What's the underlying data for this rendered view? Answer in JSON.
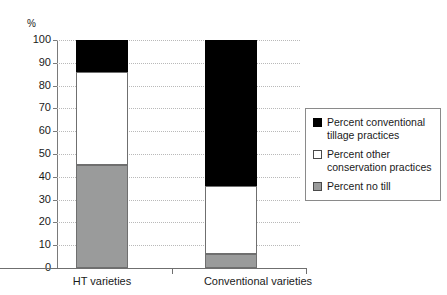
{
  "chart_data": {
    "type": "bar",
    "subtype": "stacked-bar-100",
    "title": "",
    "subtitle": "",
    "xlabel": "",
    "ylabel": "%",
    "ylim": [
      0,
      100
    ],
    "ytick_values": [
      0,
      10,
      20,
      30,
      40,
      50,
      60,
      70,
      80,
      90,
      100
    ],
    "ytick_labels": [
      "0",
      "10",
      "20",
      "30",
      "40",
      "50",
      "60",
      "70",
      "80",
      "90",
      "100"
    ],
    "grid": "horizontal-dotted",
    "legend_position": "right",
    "categories": [
      "HT varieties",
      "Conventional varieties"
    ],
    "series": [
      {
        "name": "Percent no till",
        "color": "#9a9b9b",
        "values": [
          45,
          6
        ]
      },
      {
        "name": "Percent other conservation practices",
        "color": "#ffffff",
        "values": [
          41,
          30
        ]
      },
      {
        "name": "Percent conventional tillage practices",
        "color": "#000000",
        "values": [
          14,
          64
        ]
      }
    ],
    "stack_boundaries": {
      "HT varieties": [
        0,
        45,
        86,
        100
      ],
      "Conventional varieties": [
        0,
        6,
        36,
        100
      ]
    }
  },
  "axis": {
    "unit_label": "%",
    "ticks": [
      {
        "label": "100",
        "value": 100
      },
      {
        "label": "90",
        "value": 90
      },
      {
        "label": "80",
        "value": 80
      },
      {
        "label": "70",
        "value": 70
      },
      {
        "label": "60",
        "value": 60
      },
      {
        "label": "50",
        "value": 50
      },
      {
        "label": "40",
        "value": 40
      },
      {
        "label": "30",
        "value": 30
      },
      {
        "label": "20",
        "value": 20
      },
      {
        "label": "10",
        "value": 10
      },
      {
        "label": "0",
        "value": 0
      }
    ]
  },
  "categories": [
    {
      "label": "HT varieties"
    },
    {
      "label": "Conventional varieties"
    }
  ],
  "legend": {
    "items": [
      {
        "label": "Percent conventional tillage practices",
        "swatch": "black"
      },
      {
        "label": "Percent other conservation practices",
        "swatch": "white"
      },
      {
        "label": "Percent no till",
        "swatch": "gray"
      }
    ]
  }
}
